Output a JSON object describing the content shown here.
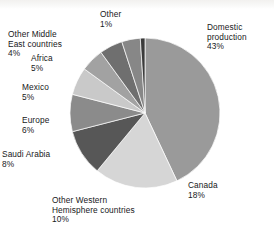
{
  "chart_data": {
    "type": "pie",
    "title": "",
    "subtitle": "",
    "xlabel": "",
    "ylabel": "",
    "legend_position": "none",
    "grid": false,
    "value_unit": "percent",
    "start_angle_deg": 0,
    "direction": "clockwise",
    "categories": [
      "Domestic production",
      "Canada",
      "Other Western Hemisphere countries",
      "Saudi Arabia",
      "Europe",
      "Mexico",
      "Africa",
      "Other Middle East countries",
      "Other"
    ],
    "values": [
      43,
      18,
      10,
      8,
      6,
      5,
      5,
      4,
      1
    ],
    "colors": [
      "#9a9a9a",
      "#d6d6d6",
      "#575757",
      "#8b8b8b",
      "#c9c9c9",
      "#a2a2a2",
      "#6f6f6f",
      "#878787",
      "#3a3a3a"
    ],
    "slices": [
      {
        "label": "Domestic production",
        "value": 43,
        "value_text": "43%",
        "color": "#9a9a9a"
      },
      {
        "label": "Canada",
        "value": 18,
        "value_text": "18%",
        "color": "#d6d6d6"
      },
      {
        "label": "Other Western Hemisphere countries",
        "value": 10,
        "value_text": "10%",
        "color": "#575757"
      },
      {
        "label": "Saudi Arabia",
        "value": 8,
        "value_text": "8%",
        "color": "#8b8b8b"
      },
      {
        "label": "Europe",
        "value": 6,
        "value_text": "6%",
        "color": "#c9c9c9"
      },
      {
        "label": "Mexico",
        "value": 5,
        "value_text": "5%",
        "color": "#a2a2a2"
      },
      {
        "label": "Africa",
        "value": 5,
        "value_text": "5%",
        "color": "#6f6f6f"
      },
      {
        "label": "Other Middle East countries",
        "value": 4,
        "value_text": "4%",
        "color": "#878787"
      },
      {
        "label": "Other",
        "value": 1,
        "value_text": "1%",
        "color": "#3a3a3a"
      }
    ]
  },
  "labels": {
    "domestic": "Domestic\nproduction\n43%",
    "canada": "Canada\n18%",
    "other_western": "Other Western\nHemisphere countries\n10%",
    "saudi_arabia": "Saudi Arabia\n8%",
    "europe": "Europe\n6%",
    "mexico": "Mexico\n5%",
    "africa": "Africa\n5%",
    "other_mideast": "Other Middle\nEast countries\n4%",
    "other": "Other\n1%"
  },
  "geometry": {
    "center_x": 145,
    "center_y": 113,
    "radius": 75
  }
}
